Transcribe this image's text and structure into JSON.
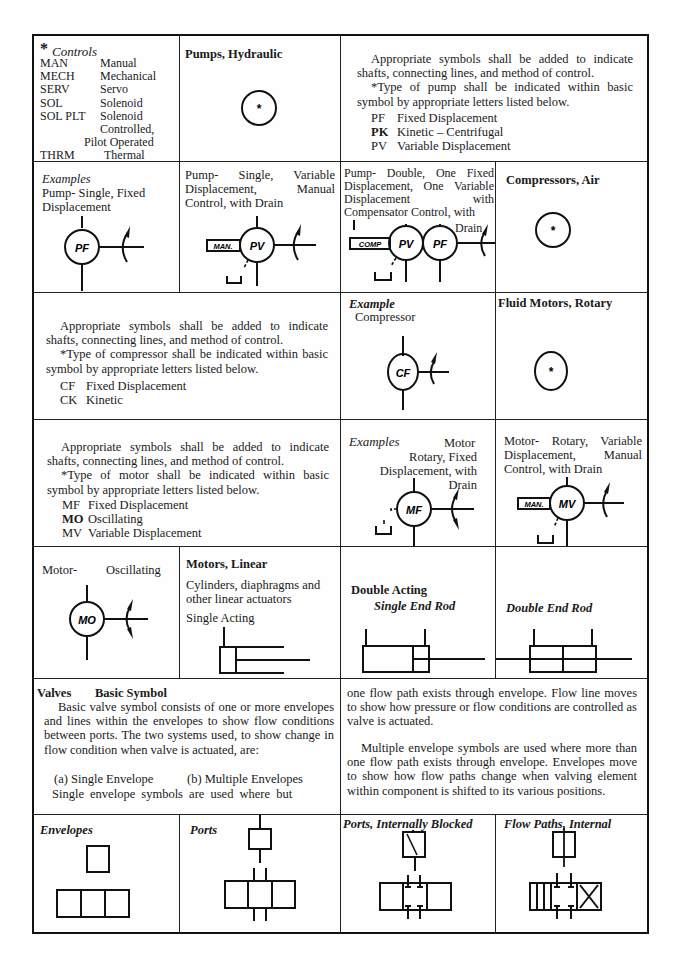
{
  "controls": {
    "title_prefix": "*",
    "title": "Controls",
    "items": [
      {
        "code": "MAN",
        "label": "Manual"
      },
      {
        "code": "MECH",
        "label": "Mechanical"
      },
      {
        "code": "SERV",
        "label": "Servo"
      },
      {
        "code": "SOL",
        "label": "Solenoid"
      },
      {
        "code": "SOL PLT",
        "label": "Solenoid"
      },
      {
        "code": "",
        "label": "Controlled,"
      },
      {
        "code": "",
        "label": "Pilot Operated"
      },
      {
        "code": "THRM",
        "label": "Thermal"
      }
    ]
  },
  "pumps": {
    "title": "Pumps, Hydraulic",
    "symbol_mark": "*",
    "note_1": "Appropriate symbols shall be added to indicate shafts, connecting lines, and method of control.",
    "note_2": "*Type of pump shall be indicated within basic symbol by appropriate letters listed below.",
    "codes": [
      {
        "code": "PF",
        "label": "Fixed Displacement"
      },
      {
        "code": "PK",
        "label": "Kinetic – Centrifugal"
      },
      {
        "code": "PV",
        "label": "Variable Displacement"
      }
    ],
    "example_heading": "Examples",
    "example_1": "Pump- Single, Fixed Displacement",
    "example_1_symbol": "PF",
    "example_2": "Pump-  Single, Variable Displacement,  Manual Control, with Drain",
    "example_2_control": "MAN.",
    "example_2_symbol": "PV",
    "example_3": "Pump- Double, One Fixed Displacement, One Variable Displacement with Compensator Control, with",
    "example_3_drain": "Drain",
    "example_3_control": "COMP",
    "example_3_symbols": [
      "PV",
      "PF"
    ]
  },
  "compressors": {
    "title": "Compressors, Air",
    "symbol_mark": "*",
    "note_1": "Appropriate symbols shall be added to indicate shafts, connecting lines, and method of control.",
    "note_2": "*Type of compressor shall be indicated within basic symbol by appropriate letters listed below.",
    "codes": [
      {
        "code": "CF",
        "label": "Fixed Displacement"
      },
      {
        "code": "CK",
        "label": "Kinetic"
      }
    ],
    "example_heading": "Example",
    "example_label": "Compressor",
    "example_symbol": "CF"
  },
  "motors_rotary": {
    "title": "Fluid Motors, Rotary",
    "symbol_mark": "*",
    "note_1": "Appropriate symbols shall be added to indicate shafts, connecting lines, and method of control.",
    "note_2": "*Type of motor shall be indicated within basic symbol by appropriate letters listed below.",
    "codes": [
      {
        "code": "MF",
        "label": "Fixed Displacement"
      },
      {
        "code": "MO",
        "label": "Oscillating"
      },
      {
        "code": "MV",
        "label": "Variable Displacement"
      }
    ],
    "example_heading": "Examples",
    "example_1_tail": "Motor",
    "example_1": "Rotary, Fixed Displacement, with Drain",
    "example_1_symbol": "MF",
    "example_2": "Motor- Rotary, Variable Displacement,  Manual Control, with Drain",
    "example_2_control": "MAN.",
    "example_2_symbol": "MV",
    "example_3_left": "Motor-",
    "example_3_right": "Oscillating",
    "example_3_symbol": "MO"
  },
  "motors_linear": {
    "title": "Motors, Linear",
    "subtitle": "Cylinders, diaphragms and other linear actuators",
    "single_acting": "Single Acting",
    "double_acting": "Double Acting",
    "single_end_rod": "Single End Rod",
    "double_end_rod": "Double End Rod"
  },
  "valves": {
    "title": "Valves",
    "subtitle": "Basic Symbol",
    "para_1": "Basic valve symbol consists of one or more envelopes and lines within the envelopes to show flow conditions between ports. The two systems used, to show change in flow condition when valve is actuated, are:",
    "option_a": "(a) Single Envelope",
    "option_b": "(b) Multiple Envelopes",
    "para_2a": "Single envelope symbols are used where but",
    "para_2b": "one flow path exists through envelope. Flow line moves to show how pressure or flow conditions are controlled as valve is actuated.",
    "para_3": "Multiple envelope symbols are used where more than one flow path exists through envelope. Envelopes move to show how flow paths change when valving element within component is shifted to its various positions.",
    "envelopes": "Envelopes",
    "ports": "Ports",
    "ports_blocked": "Ports, Internally Blocked",
    "flow_paths": "Flow Paths, Internal"
  }
}
